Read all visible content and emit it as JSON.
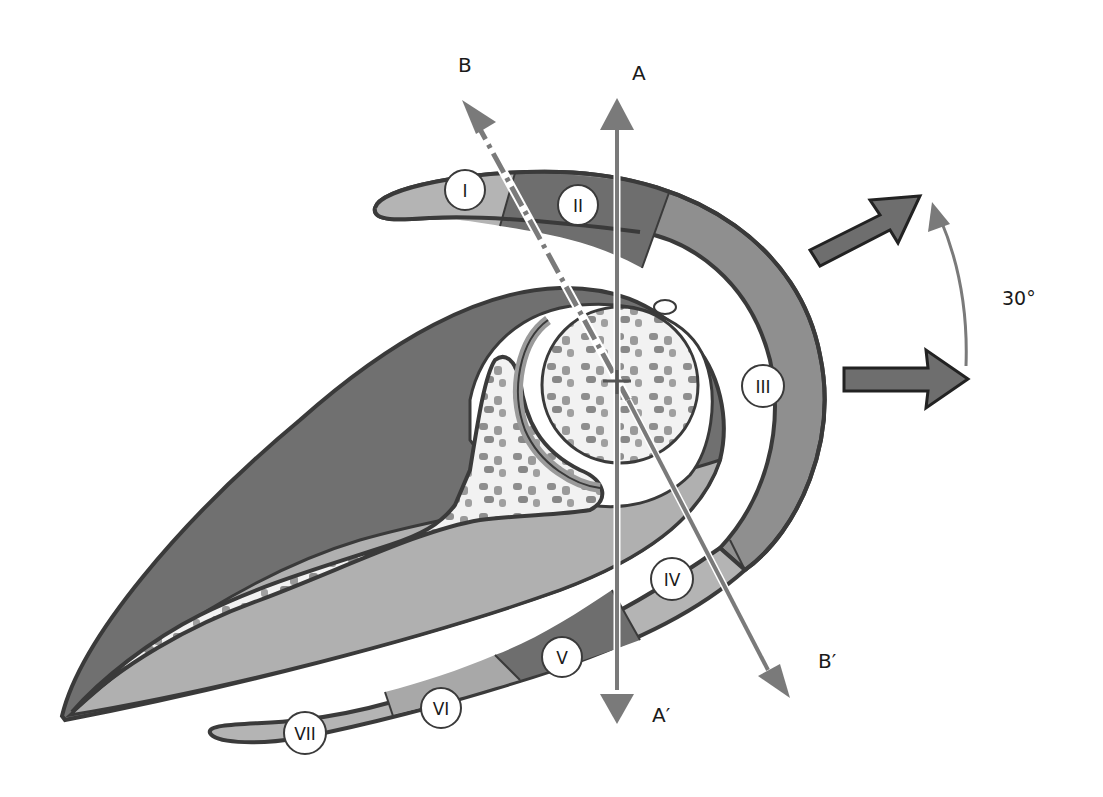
{
  "diagram": {
    "colors": {
      "background": "#ffffff",
      "outline": "#3a3a3a",
      "muscle_dark": "#6e6e6e",
      "muscle_mid": "#8f8f8f",
      "muscle_light": "#b4b4b4",
      "bone_fill": "#f2f2f2",
      "bone_speckle": "#8a8a8a",
      "axis_arrow": "#7a7a7a",
      "label_circle": "#ffffff"
    },
    "axes": [
      {
        "id": "A",
        "start_label": "A",
        "end_label": "A′",
        "style": "solid",
        "orientation": "vertical"
      },
      {
        "id": "B",
        "start_label": "B",
        "end_label": "B′",
        "style": "dash-dot",
        "orientation": "oblique"
      }
    ],
    "zones": [
      {
        "label": "I",
        "shade": "light"
      },
      {
        "label": "II",
        "shade": "dark"
      },
      {
        "label": "III",
        "shade": "mid"
      },
      {
        "label": "IV",
        "shade": "light"
      },
      {
        "label": "V",
        "shade": "dark"
      },
      {
        "label": "VI",
        "shade": "light"
      },
      {
        "label": "VII",
        "shade": "light"
      }
    ],
    "rotation": {
      "angle_label": "30°",
      "arrows": [
        "horizontal-arrow",
        "rotated-arrow"
      ]
    }
  }
}
